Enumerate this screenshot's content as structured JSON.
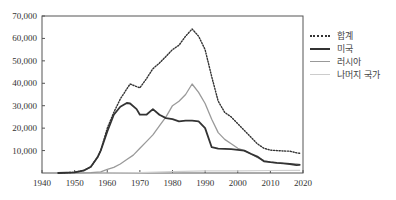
{
  "chart_data": {
    "type": "line",
    "title": "",
    "xlabel": "",
    "ylabel": "",
    "xlim": [
      1940,
      2020
    ],
    "ylim": [
      0,
      70000
    ],
    "grid": false,
    "legend_position": "right",
    "x_ticks": [
      1940,
      1950,
      1960,
      1970,
      1980,
      1990,
      2000,
      2010,
      2020
    ],
    "y_ticks": [
      10000,
      20000,
      30000,
      40000,
      50000,
      60000,
      70000
    ],
    "x_tick_labels": [
      "1940",
      "1950",
      "1960",
      "1970",
      "1980",
      "1990",
      "2000",
      "2010",
      "2020"
    ],
    "y_tick_labels": [
      "10,000",
      "20,000",
      "30,000",
      "40,000",
      "50,000",
      "60,000",
      "70,000"
    ],
    "series": [
      {
        "name": "합계",
        "style": "dotted",
        "color": "#333333",
        "x": [
          1945,
          1950,
          1953,
          1955,
          1957,
          1958,
          1960,
          1962,
          1964,
          1966,
          1967,
          1969,
          1970,
          1972,
          1974,
          1976,
          1978,
          1980,
          1982,
          1984,
          1986,
          1988,
          1990,
          1992,
          1994,
          1996,
          1998,
          2000,
          2002,
          2004,
          2006,
          2008,
          2010,
          2012,
          2014,
          2016,
          2018,
          2019
        ],
        "values": [
          0,
          300,
          1200,
          2800,
          7000,
          10000,
          20000,
          27000,
          33000,
          37500,
          39700,
          38500,
          38000,
          42000,
          46500,
          49000,
          52000,
          55000,
          57000,
          61000,
          64200,
          61000,
          55000,
          43000,
          32000,
          27000,
          25000,
          22000,
          19000,
          16000,
          13000,
          11000,
          10200,
          10000,
          9800,
          9700,
          9000,
          8800
        ]
      },
      {
        "name": "미국",
        "style": "solid-thick",
        "color": "#333333",
        "x": [
          1945,
          1950,
          1953,
          1955,
          1957,
          1958,
          1960,
          1962,
          1964,
          1966,
          1967,
          1969,
          1970,
          1972,
          1974,
          1976,
          1978,
          1980,
          1982,
          1984,
          1986,
          1988,
          1990,
          1992,
          1994,
          1996,
          1998,
          2000,
          2002,
          2004,
          2006,
          2008,
          2010,
          2012,
          2014,
          2016,
          2018,
          2019
        ],
        "values": [
          0,
          300,
          1200,
          2800,
          7000,
          10000,
          18500,
          26000,
          29500,
          31200,
          31000,
          28500,
          26000,
          26000,
          28500,
          26000,
          24500,
          24000,
          23000,
          23300,
          23300,
          23000,
          20000,
          11500,
          10900,
          10800,
          10600,
          10300,
          10000,
          8600,
          7300,
          5200,
          4800,
          4500,
          4300,
          4000,
          3500,
          3600
        ]
      },
      {
        "name": "러시아",
        "style": "solid",
        "color": "#999999",
        "x": [
          1945,
          1950,
          1955,
          1958,
          1960,
          1962,
          1964,
          1966,
          1968,
          1970,
          1972,
          1974,
          1976,
          1978,
          1980,
          1982,
          1984,
          1986,
          1988,
          1990,
          1992,
          1994,
          1996,
          1998,
          2000,
          2002,
          2004,
          2006,
          2008,
          2010,
          2012,
          2014,
          2016,
          2018,
          2019
        ],
        "values": [
          0,
          0,
          200,
          500,
          1600,
          2500,
          4000,
          6000,
          8000,
          11000,
          14000,
          17000,
          21000,
          25000,
          30000,
          32000,
          35000,
          39700,
          36000,
          31000,
          24000,
          18000,
          15000,
          13000,
          11000,
          10000,
          8500,
          7000,
          5500,
          4800,
          4500,
          4300,
          4200,
          4000,
          3900
        ]
      },
      {
        "name": "나머지 국가",
        "style": "solid-light",
        "color": "#cccccc",
        "x": [
          1945,
          1960,
          1970,
          1980,
          1990,
          2000,
          2010,
          2019
        ],
        "values": [
          0,
          0,
          200,
          600,
          1000,
          1000,
          1100,
          1200
        ]
      }
    ]
  },
  "legend": {
    "items": [
      {
        "label": "합계"
      },
      {
        "label": "미국"
      },
      {
        "label": "러시아"
      },
      {
        "label": "나머지 국가"
      }
    ]
  }
}
